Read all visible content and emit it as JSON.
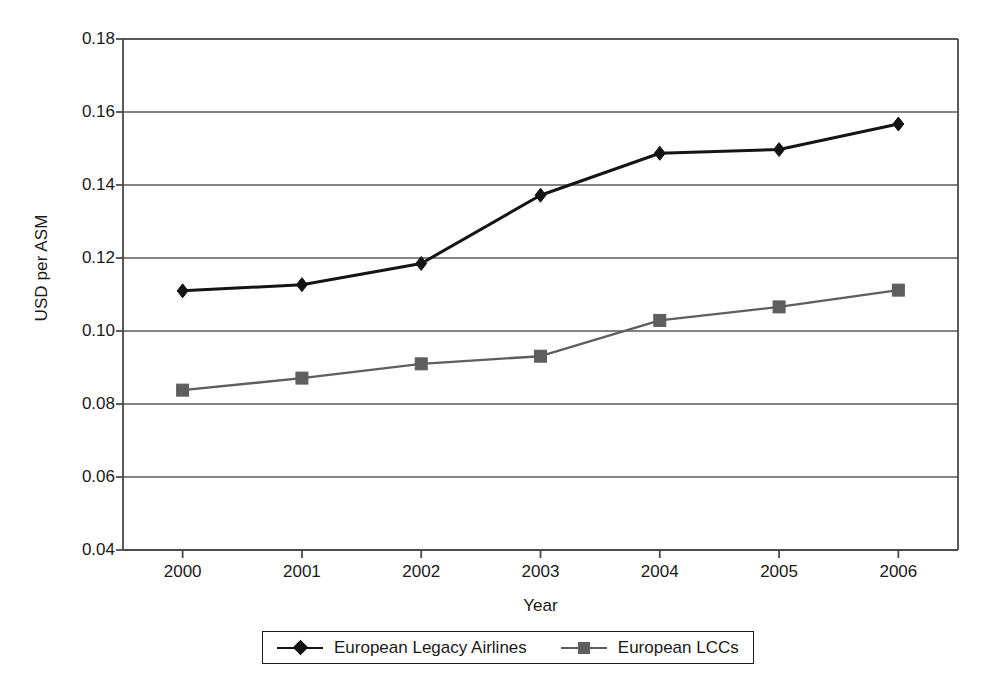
{
  "chart_data": {
    "type": "line",
    "title": "",
    "xlabel": "Year",
    "ylabel": "USD per ASM",
    "categories": [
      "2000",
      "2001",
      "2002",
      "2003",
      "2004",
      "2005",
      "2006"
    ],
    "x": [
      2000,
      2001,
      2002,
      2003,
      2004,
      2005,
      2006
    ],
    "xlim": [
      1999.5,
      2006.5
    ],
    "ylim": [
      0.04,
      0.18
    ],
    "yticks": [
      "0.04",
      "0.06",
      "0.08",
      "0.10",
      "0.12",
      "0.14",
      "0.16",
      "0.18"
    ],
    "ytick_values": [
      0.04,
      0.06,
      0.08,
      0.1,
      0.12,
      0.14,
      0.16,
      0.18
    ],
    "grid": "horizontal",
    "legend_position": "bottom",
    "series": [
      {
        "name": "European Legacy Airlines",
        "marker": "diamond",
        "color": "#141414",
        "values": [
          0.111,
          0.1127,
          0.1185,
          0.1372,
          0.1487,
          0.1497,
          0.1567
        ]
      },
      {
        "name": "European LCCs",
        "marker": "square",
        "color": "#5e5e5e",
        "values": [
          0.0838,
          0.0871,
          0.091,
          0.0931,
          0.1029,
          0.1066,
          0.1112
        ]
      }
    ]
  },
  "axes": {
    "axis_color": "#4a4a4a",
    "grid_color": "#5a5a5a",
    "background": "#ffffff"
  },
  "plot_box": {
    "left": 123,
    "right": 958,
    "top": 39,
    "bottom": 550
  }
}
